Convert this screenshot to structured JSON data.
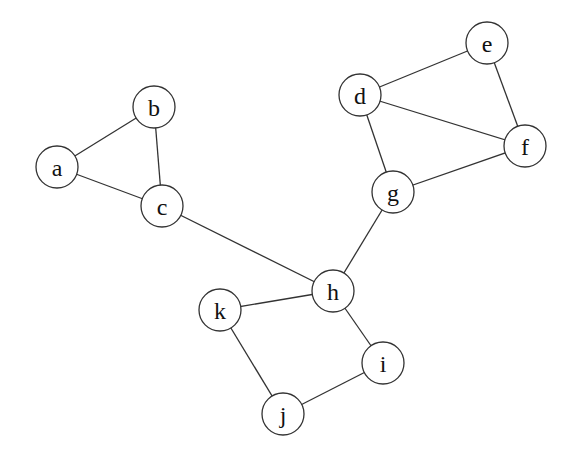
{
  "graph": {
    "radius": 21,
    "nodes": [
      {
        "id": "a",
        "label": "a",
        "x": 57,
        "y": 167
      },
      {
        "id": "b",
        "label": "b",
        "x": 154,
        "y": 107
      },
      {
        "id": "c",
        "label": "c",
        "x": 162,
        "y": 206
      },
      {
        "id": "d",
        "label": "d",
        "x": 360,
        "y": 95
      },
      {
        "id": "e",
        "label": "e",
        "x": 487,
        "y": 43
      },
      {
        "id": "f",
        "label": "f",
        "x": 525,
        "y": 146
      },
      {
        "id": "g",
        "label": "g",
        "x": 393,
        "y": 192
      },
      {
        "id": "h",
        "label": "h",
        "x": 333,
        "y": 291
      },
      {
        "id": "i",
        "label": "i",
        "x": 383,
        "y": 363
      },
      {
        "id": "j",
        "label": "j",
        "x": 283,
        "y": 414
      },
      {
        "id": "k",
        "label": "k",
        "x": 220,
        "y": 310
      }
    ],
    "edges": [
      [
        "a",
        "b"
      ],
      [
        "a",
        "c"
      ],
      [
        "b",
        "c"
      ],
      [
        "c",
        "h"
      ],
      [
        "d",
        "e"
      ],
      [
        "d",
        "f"
      ],
      [
        "e",
        "f"
      ],
      [
        "d",
        "g"
      ],
      [
        "f",
        "g"
      ],
      [
        "g",
        "h"
      ],
      [
        "h",
        "k"
      ],
      [
        "h",
        "i"
      ],
      [
        "i",
        "j"
      ],
      [
        "j",
        "k"
      ]
    ]
  }
}
